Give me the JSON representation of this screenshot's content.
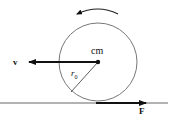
{
  "diagram": {
    "labels": {
      "center": "cm",
      "velocity": "v",
      "radius": "r",
      "radius_subscript": "0",
      "force": "F"
    },
    "elements": {
      "wheel": {
        "cx": 98,
        "cy": 62,
        "r": 39
      },
      "ground": {
        "x1": 0,
        "x2": 168,
        "y": 103
      },
      "velocity_arrow": {
        "from": [
          98,
          62
        ],
        "to": [
          28,
          62
        ],
        "direction": "left"
      },
      "radius_line": {
        "from": [
          98,
          62
        ],
        "to": [
          70,
          92
        ]
      },
      "force_arrow": {
        "from": [
          96,
          103
        ],
        "to": [
          146,
          103
        ],
        "direction": "right"
      },
      "rotation_arrow": {
        "direction": "counterclockwise"
      }
    },
    "colors": {
      "stroke": "#111111",
      "ground": "#555555",
      "wheel": "#777777"
    }
  }
}
